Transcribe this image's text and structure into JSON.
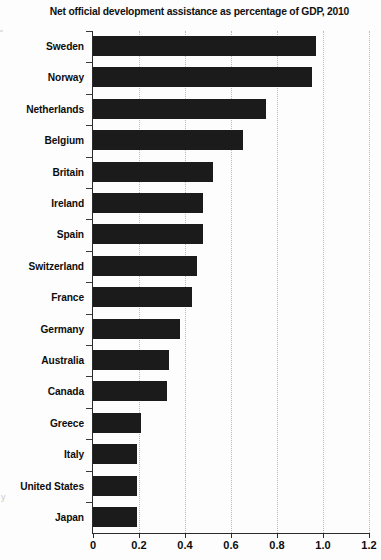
{
  "chart_data": {
    "type": "bar",
    "orientation": "horizontal",
    "title": "Net official development assistance as percentage of GDP, 2010",
    "xlabel": "",
    "ylabel": "",
    "xlim": [
      0,
      1.2
    ],
    "xticks": [
      0,
      0.2,
      0.4,
      0.6,
      0.8,
      1.0,
      1.2
    ],
    "xtick_labels": [
      "0",
      "0.2",
      "0.4",
      "0.6",
      "0.8",
      "1.0",
      "1.2"
    ],
    "grid": "vertical-dotted",
    "legend": "none",
    "bar_color": "#1b1b1b",
    "categories": [
      "Sweden",
      "Norway",
      "Netherlands",
      "Belgium",
      "Britain",
      "Ireland",
      "Spain",
      "Switzerland",
      "France",
      "Germany",
      "Australia",
      "Canada",
      "Greece",
      "Italy",
      "United States",
      "Japan"
    ],
    "values": [
      0.97,
      0.95,
      0.75,
      0.65,
      0.52,
      0.48,
      0.48,
      0.45,
      0.43,
      0.38,
      0.33,
      0.32,
      0.21,
      0.19,
      0.19,
      0.19
    ]
  }
}
